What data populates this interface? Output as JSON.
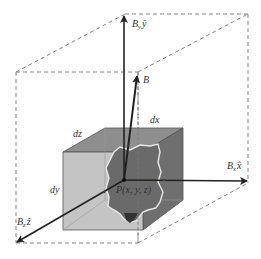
{
  "figure": {
    "type": "3d-vector-field-diagram"
  },
  "labels": {
    "by": "B",
    "by_sub": "y",
    "by_unit": "ŷ",
    "b": "B",
    "bx": "B",
    "bx_sub": "x",
    "bx_unit": "x̂",
    "bz": "B",
    "bz_sub": "z",
    "bz_unit": "ẑ",
    "dx": "dx",
    "dy": "dy",
    "dz": "dz",
    "point": "P(x, y, z)"
  },
  "colors": {
    "outline": "#555555",
    "dashed": "#777777",
    "arrow": "#222222",
    "cube_front": "#c4c4c4",
    "cube_top": "#8e8e8e",
    "cube_right": "#6f6f6f",
    "blob": "#6a6a6a",
    "blob_edge": "#e8e8e8"
  }
}
